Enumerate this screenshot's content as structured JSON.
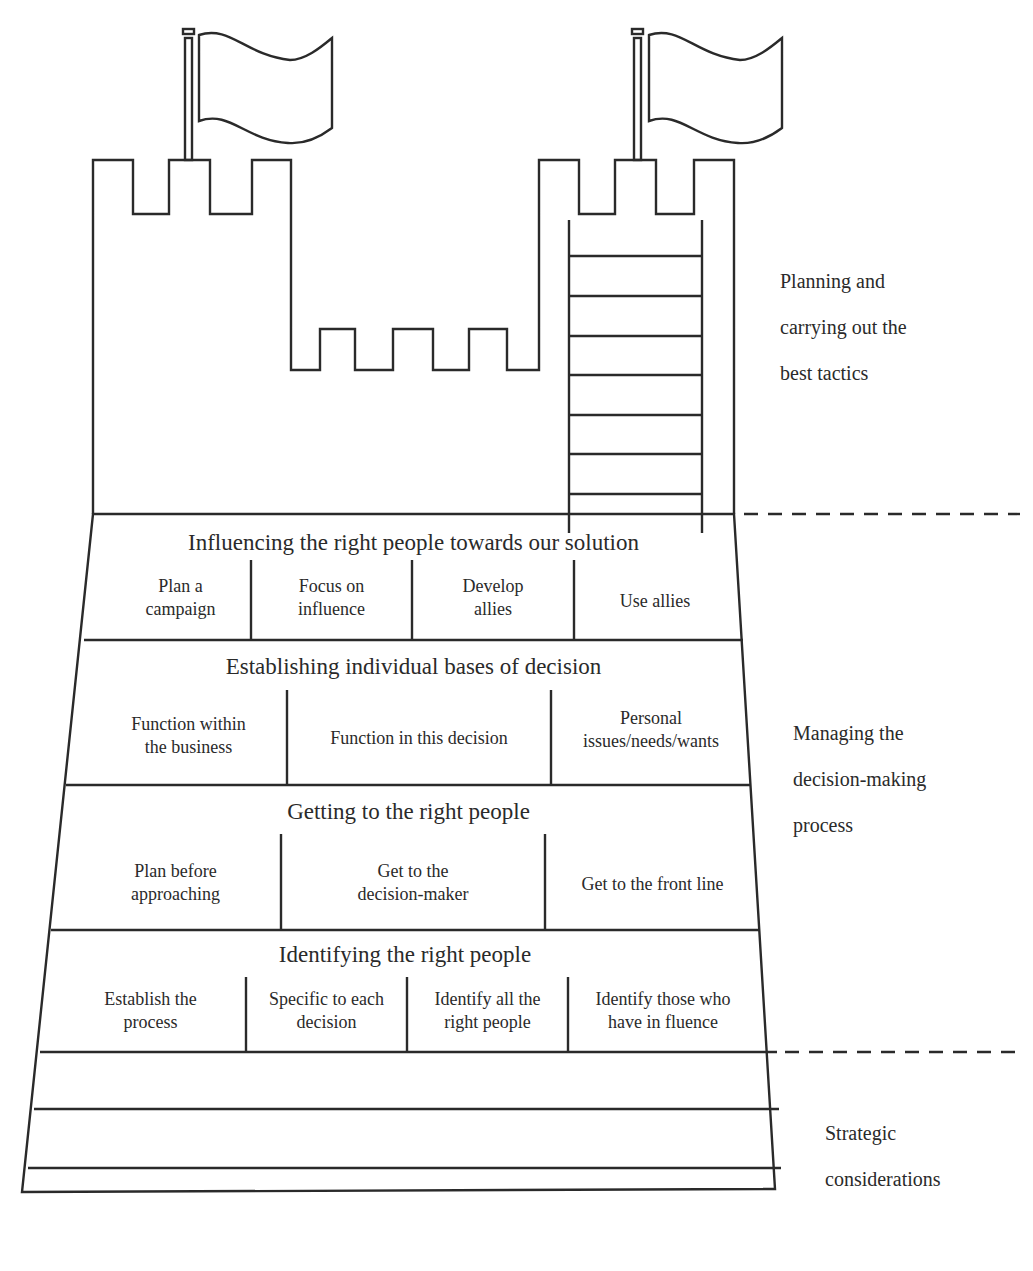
{
  "diagram": {
    "type": "castle-metaphor",
    "stroke_color": "#2a2a2a",
    "background": "#ffffff",
    "tiers": [
      {
        "title": "Influencing the right people towards our solution",
        "cells": [
          {
            "line1": "Plan a",
            "line2": "campaign"
          },
          {
            "line1": "Focus on",
            "line2": "influence"
          },
          {
            "line1": "Develop",
            "line2": "allies"
          },
          {
            "line1": "Use allies",
            "line2": ""
          }
        ]
      },
      {
        "title": "Establishing individual bases of decision",
        "cells": [
          {
            "line1": "Function within",
            "line2": "the business"
          },
          {
            "line1": "Function in this decision",
            "line2": ""
          },
          {
            "line1": "Personal",
            "line2": "issues/needs/wants"
          }
        ]
      },
      {
        "title": "Getting to the right people",
        "cells": [
          {
            "line1": "Plan before",
            "line2": "approaching"
          },
          {
            "line1": "Get to the",
            "line2": "decision-maker"
          },
          {
            "line1": "Get to the front line",
            "line2": ""
          }
        ]
      },
      {
        "title": "Identifying the right people",
        "cells": [
          {
            "line1": "Establish the",
            "line2": "process"
          },
          {
            "line1": "Specific to each",
            "line2": "decision"
          },
          {
            "line1": "Identify all the",
            "line2": "right people"
          },
          {
            "line1": "Identify those who",
            "line2": "have in fluence"
          }
        ]
      }
    ],
    "foundation_rows": 3,
    "side_labels": {
      "top": [
        "Planning and",
        "carrying out the",
        "best tactics"
      ],
      "middle": [
        "Managing the",
        "decision-making",
        "process"
      ],
      "bottom": [
        "Strategic",
        "considerations"
      ]
    }
  }
}
